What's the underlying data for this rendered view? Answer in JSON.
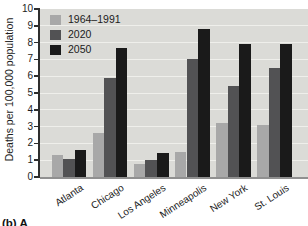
{
  "figure": {
    "caption_fragment": "(b) A"
  },
  "chart_data": {
    "type": "bar",
    "categories": [
      "Atlanta",
      "Chicago",
      "Los Angeles",
      "Minneapolis",
      "New York",
      "St. Louis"
    ],
    "series": [
      {
        "name": "1964–1991",
        "color": "#a8a8a8",
        "values": [
          1.3,
          2.6,
          0.8,
          1.5,
          3.2,
          3.1
        ]
      },
      {
        "name": "2020",
        "color": "#525254",
        "values": [
          1.1,
          5.9,
          1.0,
          7.0,
          5.4,
          6.5
        ]
      },
      {
        "name": "2050",
        "color": "#1a1a1a",
        "values": [
          1.6,
          7.7,
          1.4,
          8.8,
          7.9,
          7.9
        ]
      }
    ],
    "title": "",
    "xlabel": "",
    "ylabel": "Deaths per 100,000 population",
    "ylim": [
      0,
      10
    ],
    "y_ticks": [
      0,
      1,
      2,
      3,
      4,
      5,
      6,
      7,
      8,
      9,
      10
    ],
    "grid": "horizontal",
    "legend_position": "top-left",
    "colors": {
      "plot_bg": "#dbdbd7",
      "gridline": "#efefeb",
      "axis": "#2e2e2e",
      "baseline": "#909090",
      "text": "#1c1c1c"
    }
  }
}
